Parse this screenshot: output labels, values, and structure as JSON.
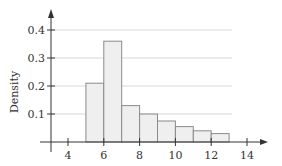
{
  "chart_data": {
    "type": "bar",
    "subtype": "histogram",
    "title": "",
    "xlabel": "",
    "ylabel": "Density",
    "bins": [
      [
        5,
        6
      ],
      [
        6,
        7
      ],
      [
        7,
        8
      ],
      [
        8,
        9
      ],
      [
        9,
        10
      ],
      [
        10,
        11
      ],
      [
        11,
        12
      ],
      [
        12,
        13
      ]
    ],
    "categories": [
      "5-6",
      "6-7",
      "7-8",
      "8-9",
      "9-10",
      "10-11",
      "11-12",
      "12-13"
    ],
    "values": [
      0.21,
      0.36,
      0.13,
      0.1,
      0.075,
      0.055,
      0.04,
      0.03
    ],
    "xlim": [
      3,
      15
    ],
    "ylim": [
      0,
      0.45
    ],
    "xticks": [
      4,
      6,
      8,
      10,
      12,
      14
    ],
    "yticks": [
      0.1,
      0.2,
      0.3,
      0.4
    ],
    "xtick_labels": [
      "4",
      "6",
      "8",
      "10",
      "12",
      "14"
    ],
    "ytick_labels": [
      "0.1",
      "0.2",
      "0.3",
      "0.4"
    ],
    "grid": "horizontal",
    "legend": null,
    "colors": {
      "bar_fill": "#efefef",
      "bar_edge": "#8a8a8a",
      "axis": "#333333",
      "grid": "#d8d8d8"
    }
  }
}
